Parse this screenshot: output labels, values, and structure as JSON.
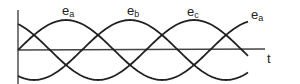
{
  "diagram": {
    "axis_label_t": "t",
    "waves": [
      {
        "name": "e",
        "sub": "a",
        "phase_deg": 0,
        "label_x": 62,
        "label_y": 5
      },
      {
        "name": "e",
        "sub": "b",
        "phase_deg": -120,
        "label_x": 127,
        "label_y": 5
      },
      {
        "name": "e",
        "sub": "c",
        "phase_deg": -240,
        "label_x": 187,
        "label_y": 5
      },
      {
        "name": "e",
        "sub": "a",
        "phase_deg": 0,
        "label_x": 251,
        "label_y": 8
      }
    ],
    "geometry": {
      "x0": 18,
      "x_end": 248,
      "y_axis": 50,
      "amplitude": 30,
      "period": 192,
      "color": "#222222"
    }
  }
}
